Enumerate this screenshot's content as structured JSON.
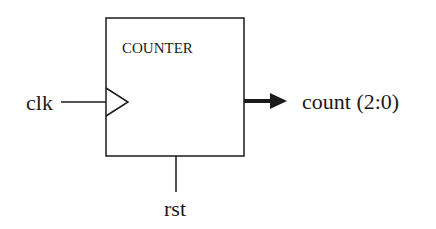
{
  "diagram": {
    "block": {
      "title": "COUNTER"
    },
    "inputs": [
      {
        "name": "clk",
        "label": "clk",
        "type": "clock"
      },
      {
        "name": "rst",
        "label": "rst",
        "type": "reset"
      }
    ],
    "outputs": [
      {
        "name": "count",
        "label": "count (2:0)",
        "type": "bus"
      }
    ],
    "colors": {
      "stroke": "#1a1a1a",
      "background": "#ffffff"
    }
  }
}
